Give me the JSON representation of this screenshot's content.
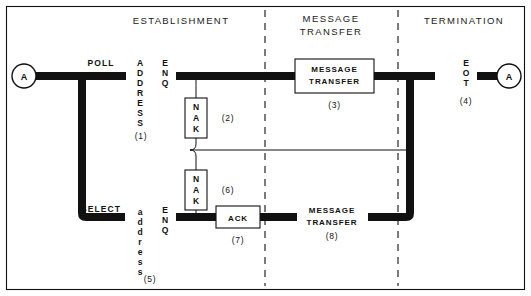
{
  "diagram": {
    "title_hidden": "",
    "phases": [
      {
        "id": "establishment",
        "label": "ESTABLISHMENT"
      },
      {
        "id": "message-transfer",
        "label_line1": "MESSAGE",
        "label_line2": "TRANSFER"
      },
      {
        "id": "termination",
        "label": "TERMINATION"
      }
    ],
    "nodes": [
      {
        "id": "node-a-left",
        "label": "A"
      },
      {
        "id": "node-a-right",
        "label": "A"
      }
    ],
    "line_labels": [
      {
        "id": "poll",
        "text": "POLL"
      },
      {
        "id": "select",
        "text": "SELECT"
      }
    ],
    "vertical_labels": [
      {
        "id": "address-upper",
        "text": "ADDRESS",
        "number": "(1)"
      },
      {
        "id": "enq-upper",
        "text": "ENQ",
        "number": ""
      },
      {
        "id": "address-lower",
        "text": "address",
        "number": "(5)"
      },
      {
        "id": "enq-lower",
        "text": "ENQ",
        "number": ""
      },
      {
        "id": "eot",
        "text": "EOT",
        "number": "(4)"
      }
    ],
    "blocks": [
      {
        "id": "nak-2",
        "text": "NAK",
        "orientation": "vertical",
        "number": "(2)"
      },
      {
        "id": "nak-6",
        "text": "NAK",
        "orientation": "vertical",
        "number": "(6)"
      },
      {
        "id": "ack-7",
        "text": "ACK",
        "orientation": "horizontal",
        "number": "(7)"
      },
      {
        "id": "message-transfer-3",
        "line1": "MESSAGE",
        "line2": "TRANSFER",
        "number": "(3)",
        "boxed": true
      },
      {
        "id": "message-transfer-8",
        "line1": "MESSAGE",
        "line2": "TRANSFER",
        "number": "(8)",
        "boxed": false
      }
    ],
    "colors": {
      "ink": "#111111",
      "paper": "#ffffff"
    }
  }
}
